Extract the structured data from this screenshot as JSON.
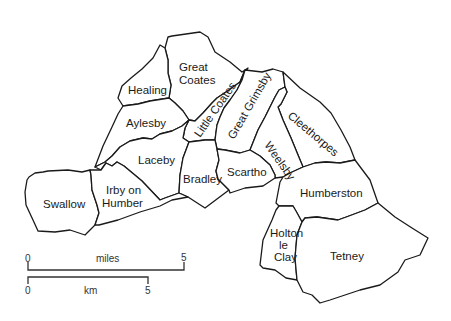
{
  "map": {
    "parishes": [
      {
        "id": "great-coates",
        "label_lines": [
          "Great",
          "Coates"
        ]
      },
      {
        "id": "healing",
        "label_lines": [
          "Healing"
        ]
      },
      {
        "id": "aylesby",
        "label_lines": [
          "Aylesby"
        ]
      },
      {
        "id": "little-coates",
        "label_lines": [
          "Little Coates"
        ]
      },
      {
        "id": "great-grimsby",
        "label_lines": [
          "Great Grimsby"
        ]
      },
      {
        "id": "cleethorpes",
        "label_lines": [
          "Cleethorpes"
        ]
      },
      {
        "id": "weelsby",
        "label_lines": [
          "Weelsby"
        ]
      },
      {
        "id": "laceby",
        "label_lines": [
          "Laceby"
        ]
      },
      {
        "id": "bradley",
        "label_lines": [
          "Bradley"
        ]
      },
      {
        "id": "scartho",
        "label_lines": [
          "Scartho"
        ]
      },
      {
        "id": "swallow",
        "label_lines": [
          "Swallow"
        ]
      },
      {
        "id": "irby-on-humber",
        "label_lines": [
          "Irby on",
          "Humber"
        ]
      },
      {
        "id": "humberston",
        "label_lines": [
          "Humberston"
        ]
      },
      {
        "id": "holton-le-clay",
        "label_lines": [
          "Holton",
          "le",
          "Clay"
        ]
      },
      {
        "id": "tetney",
        "label_lines": [
          "Tetney"
        ]
      }
    ],
    "scale_bars": {
      "miles": {
        "unit": "miles",
        "start": "0",
        "end": "5"
      },
      "km": {
        "unit": "km",
        "start": "0",
        "end": "5"
      }
    },
    "colors": {
      "stroke": "#1a1a1a",
      "fill": "#ffffff",
      "background": "#ffffff"
    }
  }
}
